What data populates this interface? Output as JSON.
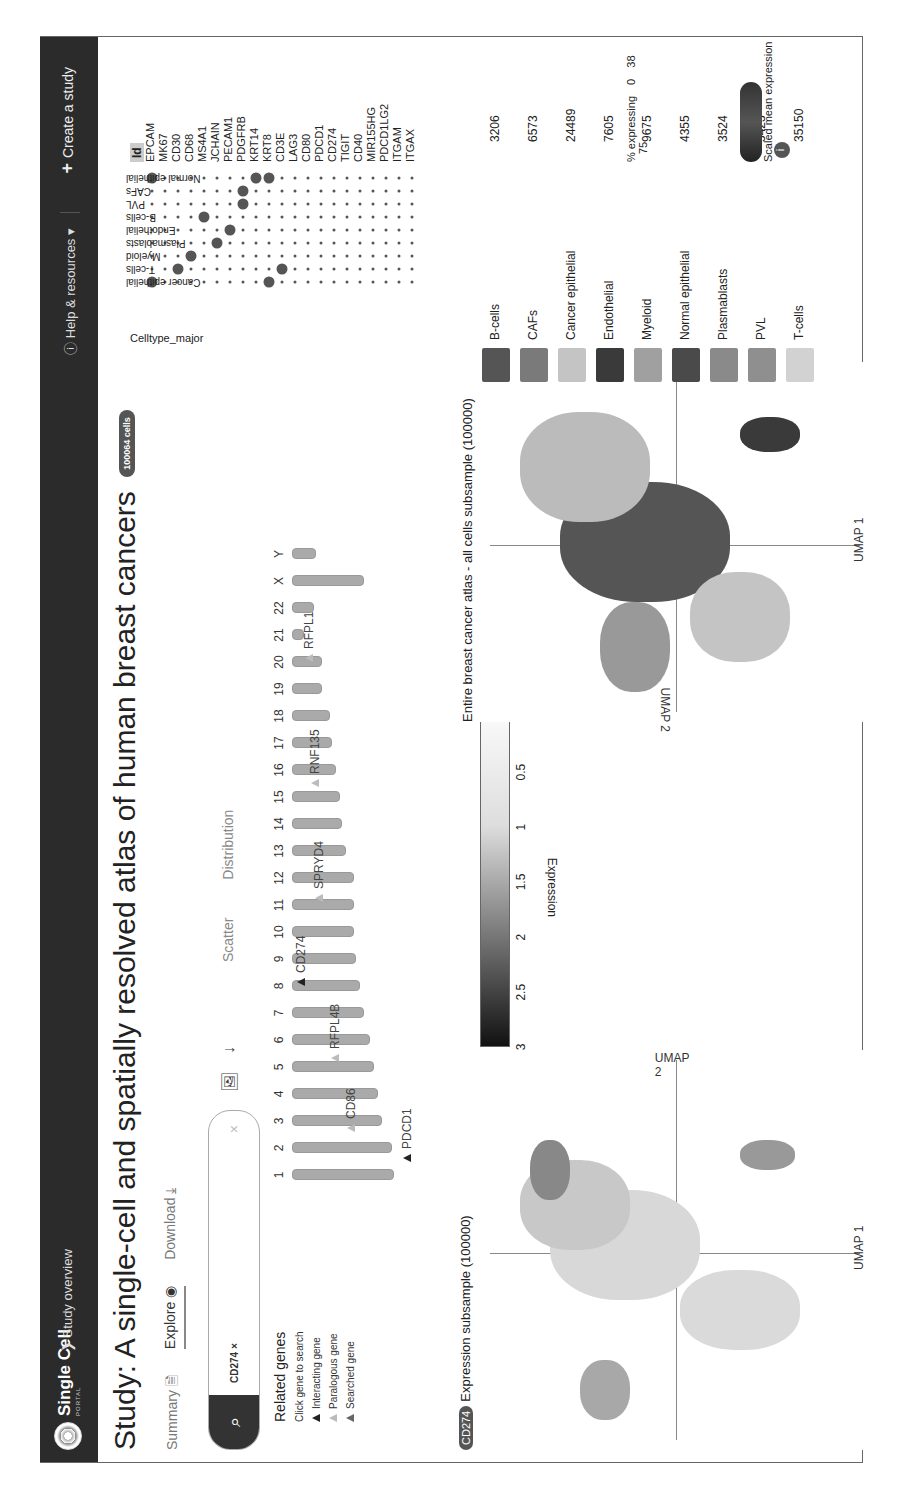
{
  "nav": {
    "logo": "Single Cell",
    "logo_sub": "PORTAL",
    "breadcrumb": "Study overview",
    "help": "Help & resources",
    "create": "Create a study"
  },
  "study": {
    "title": "Study: A single-cell and spatially resolved atlas of human breast cancers",
    "cell_badge": "100064 cells"
  },
  "tabs": [
    {
      "label": "Summary",
      "icon": "summary-doc-icon"
    },
    {
      "label": "Explore",
      "icon": "eye-icon",
      "active": true
    },
    {
      "label": "Download",
      "icon": "download-icon"
    }
  ],
  "search": {
    "chip": "CD274",
    "chip_remove": "×",
    "clear": "×",
    "search_icon": "search-icon"
  },
  "view_tabs": [
    "Scatter",
    "Distribution"
  ],
  "related_genes": {
    "title": "Related genes",
    "hint": "Click gene to search",
    "legend": [
      "Interacting gene",
      "Paralogous gene",
      "Searched gene"
    ]
  },
  "chromosomes": [
    "1",
    "2",
    "3",
    "4",
    "5",
    "6",
    "7",
    "8",
    "9",
    "10",
    "11",
    "12",
    "13",
    "14",
    "15",
    "16",
    "17",
    "18",
    "19",
    "20",
    "21",
    "22",
    "X",
    "Y"
  ],
  "genes_on_ideogram": [
    {
      "name": "PDCD1",
      "chr": "2",
      "type": "interacting"
    },
    {
      "name": "CD86",
      "chr": "3",
      "type": "paralogous"
    },
    {
      "name": "RFPL4B",
      "chr": "6",
      "type": "paralogous"
    },
    {
      "name": "CD274",
      "chr": "9",
      "type": "searched"
    },
    {
      "name": "SPRYD4",
      "chr": "12",
      "type": "paralogous"
    },
    {
      "name": "RNF135",
      "chr": "17",
      "type": "paralogous"
    },
    {
      "name": "RFPL1",
      "chr": "22",
      "type": "paralogous"
    }
  ],
  "plot1": {
    "gene_badge": "CD274",
    "title": "Expression subsample (100000)",
    "xlabel": "UMAP 1",
    "ylabel": "UMAP 2",
    "colorbar_label": "Expression",
    "colorbar_ticks": [
      "0",
      "0.5",
      "1",
      "1.5",
      "2",
      "2.5",
      "3"
    ]
  },
  "plot2": {
    "title": "Entire breast cancer atlas - all cells subsample (100000)",
    "xlabel": "UMAP 1",
    "ylabel": "UMAP 2",
    "legend": [
      {
        "name": "B-cells",
        "count": "3206",
        "color": "#555555"
      },
      {
        "name": "CAFs",
        "count": "6573",
        "color": "#7a7a7a"
      },
      {
        "name": "Cancer epithelial",
        "count": "24489",
        "color": "#c4c4c4"
      },
      {
        "name": "Endothelial",
        "count": "7605",
        "color": "#3a3a3a"
      },
      {
        "name": "Myeloid",
        "count": "9675",
        "color": "#a0a0a0"
      },
      {
        "name": "Normal epithelial",
        "count": "4355",
        "color": "#4a4a4a"
      },
      {
        "name": "Plasmablasts",
        "count": "3524",
        "color": "#8a8a8a"
      },
      {
        "name": "PVL",
        "count": "5423",
        "color": "#8f8f8f"
      },
      {
        "name": "T-cells",
        "count": "35150",
        "color": "#d2d2d2"
      }
    ]
  },
  "dotplot": {
    "group_label": "Celltype_major",
    "annotation_header": "Id",
    "celltypes": [
      "Cancer epithelial",
      "T-cells",
      "Myeloid",
      "Plasmablasts",
      "Endothelial",
      "B-cells",
      "PVL",
      "CAFs",
      "Normal epithelial"
    ],
    "genes": [
      "EPCAM",
      "MK67",
      "CD30",
      "CD68",
      "MS4A1",
      "JCHAIN",
      "PECAM1",
      "PDGFRB",
      "KRT14",
      "KRT8",
      "CD3E",
      "LAG3",
      "CD80",
      "PDCD1",
      "CD274",
      "TIGIT",
      "CD40",
      "MIR155HG",
      "PDCD1LG2",
      "ITGAM",
      "ITGAX"
    ],
    "size_legend": {
      "label": "% expressing",
      "ticks": [
        "0",
        "38",
        "75"
      ]
    },
    "color_legend": {
      "label": "Scaled mean expression",
      "ticks": [
        "0",
        "0.5",
        "1"
      ]
    }
  },
  "chart_data": {
    "type": "scatter",
    "x": [
      "EPCAM",
      "MK67",
      "CD30",
      "CD68",
      "MS4A1",
      "JCHAIN",
      "PECAM1",
      "PDGFRB",
      "KRT14",
      "KRT8",
      "CD3E",
      "LAG3",
      "CD80",
      "PDCD1",
      "CD274",
      "TIGIT",
      "CD40",
      "MIR155HG",
      "PDCD1LG2",
      "ITGAM",
      "ITGAX"
    ],
    "y": [
      "Cancer epithelial",
      "T-cells",
      "Myeloid",
      "Plasmablasts",
      "Endothelial",
      "B-cells",
      "PVL",
      "CAFs",
      "Normal epithelial"
    ],
    "large_dots": [
      {
        "celltype": "Cancer epithelial",
        "gene": "EPCAM"
      },
      {
        "celltype": "Cancer epithelial",
        "gene": "KRT8"
      },
      {
        "celltype": "T-cells",
        "gene": "CD30"
      },
      {
        "celltype": "T-cells",
        "gene": "CD3E"
      },
      {
        "celltype": "Myeloid",
        "gene": "CD68"
      },
      {
        "celltype": "Plasmablasts",
        "gene": "JCHAIN"
      },
      {
        "celltype": "Endothelial",
        "gene": "PECAM1"
      },
      {
        "celltype": "B-cells",
        "gene": "MS4A1"
      },
      {
        "celltype": "PVL",
        "gene": "PDGFRB"
      },
      {
        "celltype": "CAFs",
        "gene": "PDGFRB"
      },
      {
        "celltype": "Normal epithelial",
        "gene": "EPCAM"
      },
      {
        "celltype": "Normal epithelial",
        "gene": "KRT14"
      },
      {
        "celltype": "Normal epithelial",
        "gene": "KRT8"
      }
    ],
    "size_legend": {
      "label": "% expressing",
      "values": [
        0,
        38,
        75
      ]
    },
    "color_legend": {
      "label": "Scaled mean expression",
      "range": [
        0,
        1
      ]
    }
  }
}
